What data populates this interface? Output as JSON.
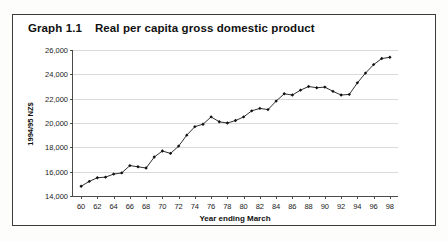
{
  "figure": {
    "title_number": "Graph 1.1",
    "title_text": "Real per capita gross domestic product",
    "border_color": "#3b3b3b",
    "background": "#ffffff"
  },
  "chart_data": {
    "type": "line",
    "title": "Real per capita gross domestic product",
    "xlabel": "Year ending March",
    "ylabel": "1994/95 NZ$",
    "xlim": [
      59,
      99
    ],
    "ylim": [
      14000,
      26000
    ],
    "ytick_step": 2000,
    "xtick_step": 2,
    "grid": "horizontal",
    "legend": "none",
    "marker": "filled-diamond",
    "line_color": "#1a1a1a",
    "marker_color": "#111111",
    "ytick_labels": [
      "14,000",
      "16,000",
      "18,000",
      "20,000",
      "22,000",
      "24,000",
      "26,000"
    ],
    "ytick_values": [
      14000,
      16000,
      18000,
      20000,
      22000,
      24000,
      26000
    ],
    "xtick_labels": [
      "60",
      "62",
      "64",
      "66",
      "68",
      "70",
      "72",
      "74",
      "76",
      "78",
      "80",
      "82",
      "84",
      "86",
      "88",
      "90",
      "92",
      "94",
      "96",
      "98"
    ],
    "xtick_values": [
      60,
      62,
      64,
      66,
      68,
      70,
      72,
      74,
      76,
      78,
      80,
      82,
      84,
      86,
      88,
      90,
      92,
      94,
      96,
      98
    ],
    "x": [
      60,
      61,
      62,
      63,
      64,
      65,
      66,
      67,
      68,
      69,
      70,
      71,
      72,
      73,
      74,
      75,
      76,
      77,
      78,
      79,
      80,
      81,
      82,
      83,
      84,
      85,
      86,
      87,
      88,
      89,
      90,
      91,
      92,
      93,
      94,
      95,
      96,
      97,
      98
    ],
    "values": [
      14800,
      15200,
      15500,
      15550,
      15800,
      15900,
      16500,
      16400,
      16300,
      17200,
      17700,
      17500,
      18100,
      19000,
      19700,
      19900,
      20500,
      20100,
      20000,
      20200,
      20500,
      21000,
      21200,
      21100,
      21800,
      22400,
      22300,
      22700,
      23000,
      22900,
      22950,
      22600,
      22300,
      22350,
      23300,
      24100,
      24800,
      25300,
      25400
    ],
    "units": "1994/95 NZ dollars per person"
  }
}
